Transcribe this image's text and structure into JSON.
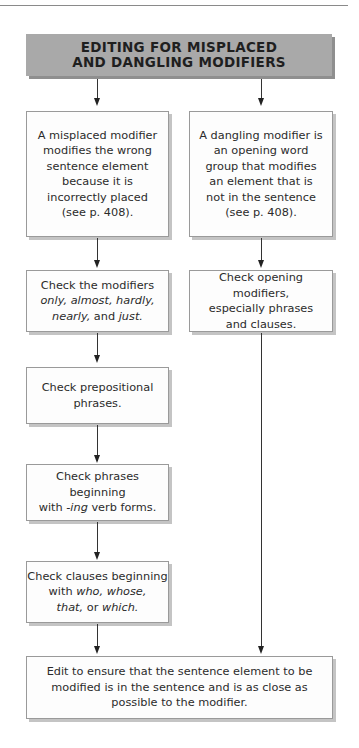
{
  "page": {
    "top_rule_visible": true
  },
  "title": {
    "line1": "EDITING FOR MISPLACED",
    "line2": "AND DANGLING MODIFIERS",
    "background": "#a9a9a9"
  },
  "left_column": {
    "definition": {
      "lines": [
        "A misplaced modifier",
        "modifies the wrong",
        "sentence element",
        "because it is",
        "incorrectly placed",
        "(see p. 408)."
      ]
    },
    "steps": [
      {
        "lines": [
          {
            "parts": [
              {
                "t": "Check the modifiers",
                "i": false
              }
            ]
          },
          {
            "parts": [
              {
                "t": "only, almost, hardly,",
                "i": true
              }
            ]
          },
          {
            "parts": [
              {
                "t": "nearly,",
                "i": true
              },
              {
                "t": " and ",
                "i": false
              },
              {
                "t": "just.",
                "i": true
              }
            ]
          }
        ]
      },
      {
        "lines": [
          {
            "parts": [
              {
                "t": "Check prepositional",
                "i": false
              }
            ]
          },
          {
            "parts": [
              {
                "t": "phrases.",
                "i": false
              }
            ]
          }
        ]
      },
      {
        "lines": [
          {
            "parts": [
              {
                "t": "Check phrases beginning",
                "i": false
              }
            ]
          },
          {
            "parts": [
              {
                "t": "with ",
                "i": false
              },
              {
                "t": "-ing",
                "i": true
              },
              {
                "t": " verb forms.",
                "i": false
              }
            ]
          }
        ]
      },
      {
        "lines": [
          {
            "parts": [
              {
                "t": "Check clauses beginning",
                "i": false
              }
            ]
          },
          {
            "parts": [
              {
                "t": "with ",
                "i": false
              },
              {
                "t": "who, whose,",
                "i": true
              }
            ]
          },
          {
            "parts": [
              {
                "t": "that,",
                "i": true
              },
              {
                "t": " or ",
                "i": false
              },
              {
                "t": "which.",
                "i": true
              }
            ]
          }
        ]
      }
    ]
  },
  "right_column": {
    "definition": {
      "lines": [
        "A dangling modifier is",
        "an opening word",
        "group that modifies",
        "an element that is",
        "not in the sentence",
        "(see p. 408)."
      ]
    },
    "steps": [
      {
        "lines": [
          {
            "parts": [
              {
                "t": "Check opening modifiers,",
                "i": false
              }
            ]
          },
          {
            "parts": [
              {
                "t": "especially phrases",
                "i": false
              }
            ]
          },
          {
            "parts": [
              {
                "t": "and clauses.",
                "i": false
              }
            ]
          }
        ]
      }
    ]
  },
  "final": {
    "lines": [
      "Edit to ensure that the sentence element to be",
      "modified is in the sentence and is as close as",
      "possible to the modifier."
    ]
  }
}
